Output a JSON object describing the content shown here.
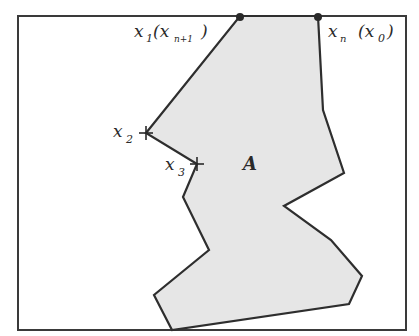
{
  "diagram": {
    "type": "polygon-region",
    "colors": {
      "background": "#ffffff",
      "frame": "#3a3a3a",
      "region_fill": "#e6e6e6",
      "outline": "#2e2e2e",
      "text": "#2a2a2a"
    },
    "frame": {
      "x": 18,
      "y": 16,
      "width": 388,
      "height": 314
    },
    "region_points": "240,16 318,16 323,110 344,173 284,206 331,240 362,276 349,304 172,330 154,295 209,250 183,197 197,164 146,133",
    "region_label": "A",
    "vertices": [
      {
        "name": "x1",
        "base": "x",
        "sub": "1",
        "alt": "(x",
        "alt_sub": "n+1",
        "alt_close": ")",
        "marker": "dot"
      },
      {
        "name": "xn",
        "base": "x",
        "sub": "n",
        "alt": "(x",
        "alt_sub": "0",
        "alt_close": ")",
        "marker": "dot"
      },
      {
        "name": "x2",
        "base": "x",
        "sub": "2",
        "marker": "cross"
      },
      {
        "name": "x3",
        "base": "x",
        "sub": "3",
        "marker": "cross"
      }
    ]
  }
}
